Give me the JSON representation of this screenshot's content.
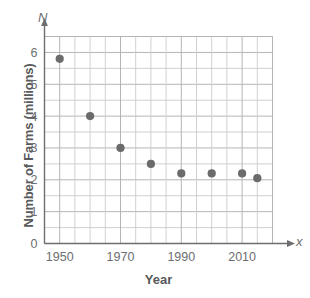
{
  "chart_data": {
    "type": "scatter",
    "title": "",
    "xlabel": "Year",
    "ylabel": "Number of Farms (millions)",
    "x_axis_variable": "x",
    "y_axis_variable": "N",
    "xlim": [
      1945,
      2020
    ],
    "ylim": [
      0,
      6.5
    ],
    "x_ticks": [
      1950,
      1970,
      1990,
      2010
    ],
    "x_tick_labels": [
      "1950",
      "1970",
      "1990",
      "2010"
    ],
    "x_minor_step": 5,
    "y_ticks": [
      0,
      1,
      2,
      3,
      4,
      5,
      6
    ],
    "y_tick_labels": [
      "0",
      "1",
      "2",
      "3",
      "4",
      "5",
      "6"
    ],
    "y_minor_step": 0.5,
    "grid": true,
    "legend": "none",
    "x": [
      1950,
      1960,
      1970,
      1980,
      1990,
      2000,
      2010,
      2015
    ],
    "values": [
      5.8,
      4.0,
      3.0,
      2.5,
      2.2,
      2.2,
      2.2,
      2.05
    ],
    "points": [
      {
        "year": 1950,
        "farms": 5.8
      },
      {
        "year": 1960,
        "farms": 4.0
      },
      {
        "year": 1970,
        "farms": 3.0
      },
      {
        "year": 1980,
        "farms": 2.5
      },
      {
        "year": 1990,
        "farms": 2.2
      },
      {
        "year": 2000,
        "farms": 2.2
      },
      {
        "year": 2010,
        "farms": 2.2
      },
      {
        "year": 2015,
        "farms": 2.05
      }
    ],
    "colors": {
      "marker": "#6b6b6b",
      "grid": "#b4b4b4",
      "minor_grid": "#cccccc",
      "axis": "#6d6e71",
      "text": "#58595b"
    }
  }
}
